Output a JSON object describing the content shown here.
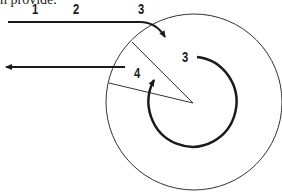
{
  "caption_fragment": "n provide.",
  "labels": {
    "top_1": "1",
    "top_2": "2",
    "top_3": "3",
    "inner_3": "3",
    "wedge_4": "4"
  },
  "colors": {
    "stroke": "#1a1a1a",
    "thin_stroke": "#333333",
    "background": "#ffffff"
  }
}
